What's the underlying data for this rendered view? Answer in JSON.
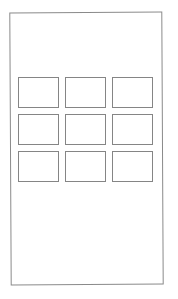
{
  "screen": {
    "width": 178,
    "height": 299,
    "frame_border_color": "#8a8a8a",
    "tile_border_color": "#858585",
    "background": "#ffffff"
  },
  "grid": {
    "rows": 3,
    "columns": 3,
    "tiles": [
      {
        "label": ""
      },
      {
        "label": ""
      },
      {
        "label": ""
      },
      {
        "label": ""
      },
      {
        "label": ""
      },
      {
        "label": ""
      },
      {
        "label": ""
      },
      {
        "label": ""
      },
      {
        "label": ""
      }
    ]
  }
}
